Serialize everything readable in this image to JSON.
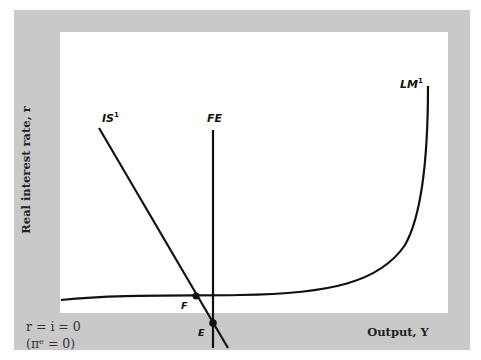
{
  "axes": {
    "y_label": "Real interest rate, r",
    "x_label": "Output, Y",
    "origin_line1": "r = i = 0",
    "origin_line2": "(πᵉ = 0)"
  },
  "curves": {
    "is": {
      "name": "IS",
      "sup": "1"
    },
    "fe": {
      "name": "FE"
    },
    "lm": {
      "name": "LM",
      "sup": "1"
    }
  },
  "points": {
    "f": "F",
    "e": "E"
  },
  "colors": {
    "frame": "#c9c9c9",
    "plot_bg": "#ffffff",
    "curve": "#111111"
  }
}
